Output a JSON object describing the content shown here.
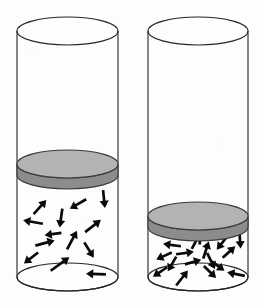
{
  "figure": {
    "title": "Two gas cylinders with pistons",
    "background_color": "#fdfdfc",
    "outline_color": "#262626",
    "arrow_color": "#0a0a0a",
    "piston_top_color": "#b3b3b3",
    "piston_side_color": "#8c8c8c",
    "panel_count": 2
  },
  "cylinders": [
    {
      "id": "left-cylinder",
      "label": "left-cylinder",
      "position": "left",
      "geometry": {
        "left_x": 17,
        "right_x": 118,
        "center_x": 67.5,
        "radius_x": 50.5,
        "ellipse_ry": 14,
        "top_center_y": 31,
        "bottom_center_y": 277
      },
      "piston": {
        "label": "left-piston",
        "top_center_y": 164,
        "thickness": 11,
        "raised": true
      },
      "gas": {
        "label": "left-gas-region",
        "top_y": 175,
        "bottom_y": 277,
        "molecule_count": 13,
        "density": "low",
        "volume": "large"
      },
      "arrows": [
        {
          "x": 40,
          "y": 207,
          "angle": -48,
          "len": 19
        },
        {
          "x": 78,
          "y": 204,
          "angle": 150,
          "len": 19
        },
        {
          "x": 104,
          "y": 199,
          "angle": 84,
          "len": 18
        },
        {
          "x": 33,
          "y": 222,
          "angle": 190,
          "len": 20
        },
        {
          "x": 61,
          "y": 218,
          "angle": 98,
          "len": 19
        },
        {
          "x": 93,
          "y": 226,
          "angle": -38,
          "len": 20
        },
        {
          "x": 45,
          "y": 243,
          "angle": -15,
          "len": 20
        },
        {
          "x": 72,
          "y": 240,
          "angle": -62,
          "len": 21
        },
        {
          "x": 89,
          "y": 250,
          "angle": 58,
          "len": 18
        },
        {
          "x": 31,
          "y": 258,
          "angle": 142,
          "len": 18
        },
        {
          "x": 60,
          "y": 264,
          "angle": -36,
          "len": 23
        },
        {
          "x": 96,
          "y": 274,
          "angle": 182,
          "len": 20
        },
        {
          "x": 53,
          "y": 234,
          "angle": 172,
          "len": 17
        }
      ]
    },
    {
      "id": "right-cylinder",
      "label": "right-cylinder",
      "position": "right",
      "geometry": {
        "left_x": 148,
        "right_x": 248,
        "center_x": 198,
        "radius_x": 50,
        "ellipse_ry": 14,
        "top_center_y": 31,
        "bottom_center_y": 277
      },
      "piston": {
        "label": "right-piston",
        "top_center_y": 216,
        "thickness": 11,
        "raised": false
      },
      "gas": {
        "label": "right-gas-region",
        "top_y": 227,
        "bottom_y": 277,
        "molecule_count": 17,
        "density": "high",
        "volume": "small"
      },
      "arrows": [
        {
          "x": 172,
          "y": 245,
          "angle": 188,
          "len": 18
        },
        {
          "x": 196,
          "y": 241,
          "angle": -62,
          "len": 18
        },
        {
          "x": 222,
          "y": 243,
          "angle": 128,
          "len": 17
        },
        {
          "x": 240,
          "y": 240,
          "angle": 86,
          "len": 17
        },
        {
          "x": 164,
          "y": 256,
          "angle": 156,
          "len": 17
        },
        {
          "x": 185,
          "y": 253,
          "angle": -8,
          "len": 18
        },
        {
          "x": 206,
          "y": 250,
          "angle": -72,
          "len": 18
        },
        {
          "x": 229,
          "y": 252,
          "angle": -42,
          "len": 17
        },
        {
          "x": 172,
          "y": 264,
          "angle": 120,
          "len": 17
        },
        {
          "x": 193,
          "y": 262,
          "angle": -16,
          "len": 17
        },
        {
          "x": 211,
          "y": 261,
          "angle": 64,
          "len": 18
        },
        {
          "x": 160,
          "y": 272,
          "angle": 146,
          "len": 17
        },
        {
          "x": 182,
          "y": 278,
          "angle": -52,
          "len": 19
        },
        {
          "x": 210,
          "y": 272,
          "angle": 44,
          "len": 17
        },
        {
          "x": 236,
          "y": 274,
          "angle": 192,
          "len": 18
        },
        {
          "x": 200,
          "y": 236,
          "angle": -88,
          "len": 17
        },
        {
          "x": 218,
          "y": 266,
          "angle": 36,
          "len": 16
        }
      ]
    }
  ]
}
